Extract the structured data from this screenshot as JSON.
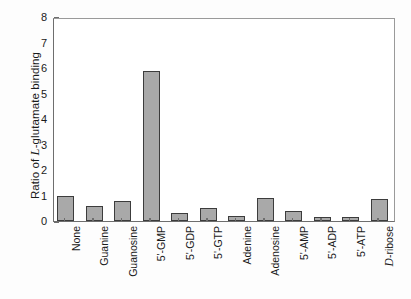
{
  "chart_data": {
    "type": "bar",
    "title": "",
    "xlabel": "",
    "ylabel": "Ratio of L-glutamate binding",
    "ylabel_parts": {
      "prefix": "Ratio of ",
      "italic": "L",
      "suffix": "-glutamate binding"
    },
    "ylim": [
      0,
      8
    ],
    "yticks": [
      0,
      1,
      2,
      3,
      4,
      5,
      6,
      7,
      8
    ],
    "ytick_labels": [
      "0",
      "1",
      "2",
      "3",
      "4",
      "5",
      "6",
      "7",
      "8"
    ],
    "grid": false,
    "legend": "none",
    "bar_color": "#a9a9a9",
    "bar_edge_color": "#3c3c3c",
    "categories": [
      "None",
      "Guanine",
      "Guanosine",
      "5'-GMP",
      "5'-GDP",
      "5'-GTP",
      "Adenine",
      "Adenosine",
      "5'-AMP",
      "5'-ADP",
      "5'-ATP",
      "D-ribose"
    ],
    "category_parts": [
      {
        "italic": "",
        "text": "None"
      },
      {
        "italic": "",
        "text": "Guanine"
      },
      {
        "italic": "",
        "text": "Guanosine"
      },
      {
        "italic": "",
        "text": "5'-GMP"
      },
      {
        "italic": "",
        "text": "5'-GDP"
      },
      {
        "italic": "",
        "text": "5'-GTP"
      },
      {
        "italic": "",
        "text": "Adenine"
      },
      {
        "italic": "",
        "text": "Adenosine"
      },
      {
        "italic": "",
        "text": "5'-AMP"
      },
      {
        "italic": "",
        "text": "5'-ADP"
      },
      {
        "italic": "",
        "text": "5'-ATP"
      },
      {
        "italic": "D",
        "text": "-ribose"
      }
    ],
    "values": [
      1.0,
      0.57,
      0.78,
      5.9,
      0.3,
      0.52,
      0.21,
      0.92,
      0.41,
      0.16,
      0.15,
      0.85
    ]
  }
}
